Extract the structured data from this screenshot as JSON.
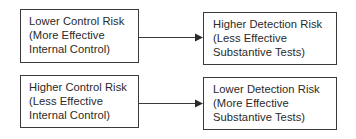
{
  "diagram": {
    "colors": {
      "stroke": "#3a3a3a",
      "text": "#2a2a2a",
      "background": "#ffffff"
    },
    "rows": [
      {
        "cause": {
          "lines": [
            "Lower Control Risk",
            "(More Effective",
            "Internal Control)"
          ]
        },
        "connector": {
          "icon": "arrow-right-icon"
        },
        "effect": {
          "lines": [
            "Higher Detection Risk",
            "(Less Effective",
            "Substantive Tests)"
          ]
        }
      },
      {
        "cause": {
          "lines": [
            "Higher Control Risk",
            "(Less Effective",
            "Internal Control)"
          ]
        },
        "connector": {
          "icon": "arrow-right-icon"
        },
        "effect": {
          "lines": [
            "Lower Detection Risk",
            "(More Effective",
            "Substantive Tests)"
          ]
        }
      }
    ]
  }
}
